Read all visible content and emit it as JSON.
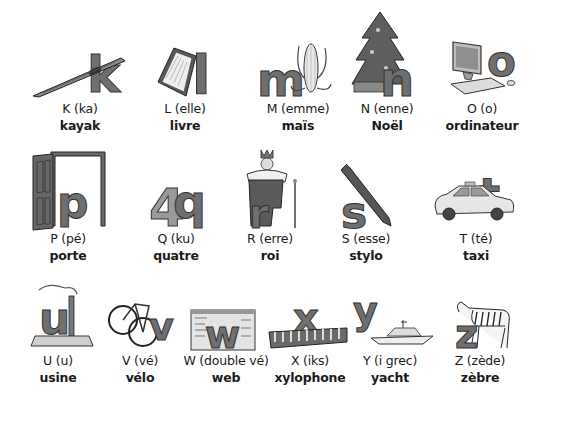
{
  "page": {
    "rows": [
      [
        {
          "letter": "k",
          "name": "K (ka)",
          "word": "kayak",
          "icon": "kayak-icon"
        },
        {
          "letter": "l",
          "name": "L (elle)",
          "word": "livre",
          "icon": "book-icon"
        },
        {
          "letter": "m",
          "name": "M (emme)",
          "word": "maïs",
          "icon": "corn-icon"
        },
        {
          "letter": "n",
          "name": "N (enne)",
          "word": "Noël",
          "icon": "christmas-tree-icon"
        },
        {
          "letter": "o",
          "name": "O (o)",
          "word": "ordinateur",
          "icon": "computer-icon"
        }
      ],
      [
        {
          "letter": "p",
          "name": "P (pé)",
          "word": "porte",
          "icon": "door-icon"
        },
        {
          "letter": "q",
          "name": "Q (ku)",
          "word": "quatre",
          "icon": "number-four-icon"
        },
        {
          "letter": "r",
          "name": "R (erre)",
          "word": "roi",
          "icon": "king-icon"
        },
        {
          "letter": "s",
          "name": "S (esse)",
          "word": "stylo",
          "icon": "pen-icon"
        },
        {
          "letter": "t",
          "name": "T (té)",
          "word": "taxi",
          "icon": "taxi-icon"
        }
      ],
      [
        {
          "letter": "u",
          "name": "U (u)",
          "word": "usine",
          "icon": "factory-icon"
        },
        {
          "letter": "v",
          "name": "V (vé)",
          "word": "vélo",
          "icon": "bicycle-icon"
        },
        {
          "letter": "w",
          "name": "W (double vé)",
          "word": "web",
          "icon": "web-page-icon"
        },
        {
          "letter": "x",
          "name": "X (iks)",
          "word": "xylophone",
          "icon": "xylophone-icon"
        },
        {
          "letter": "y",
          "name": "Y (i grec)",
          "word": "yacht",
          "icon": "yacht-icon"
        },
        {
          "letter": "z",
          "name": "Z (zède)",
          "word": "zèbre",
          "icon": "zebra-icon"
        }
      ]
    ]
  }
}
